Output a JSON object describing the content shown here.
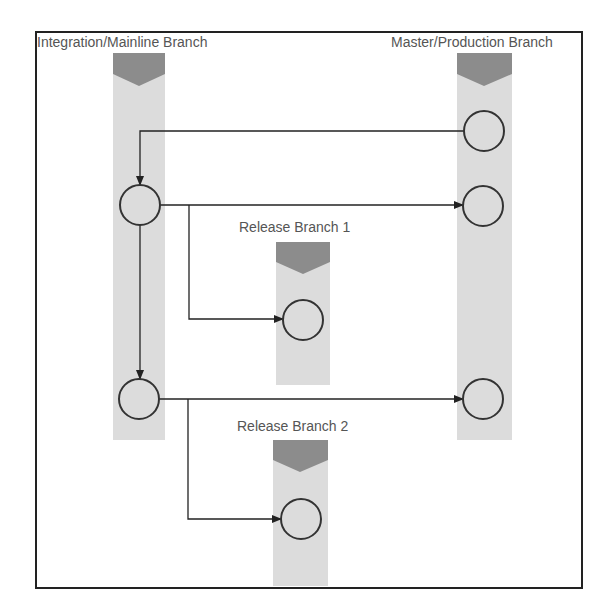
{
  "diagram": {
    "lanes": [
      {
        "id": "integration",
        "label": "Integration/Mainline Branch"
      },
      {
        "id": "master",
        "label": "Master/Production Branch"
      },
      {
        "id": "release1",
        "label": "Release Branch 1"
      },
      {
        "id": "release2",
        "label": "Release Branch 2"
      }
    ],
    "nodes": [
      {
        "id": "m1",
        "lane": "master"
      },
      {
        "id": "m2",
        "lane": "master"
      },
      {
        "id": "m3",
        "lane": "master"
      },
      {
        "id": "i1",
        "lane": "integration"
      },
      {
        "id": "i2",
        "lane": "integration"
      },
      {
        "id": "r1",
        "lane": "release1"
      },
      {
        "id": "r2",
        "lane": "release2"
      }
    ],
    "edges": [
      {
        "from": "m1",
        "to": "i1"
      },
      {
        "from": "i1",
        "to": "m2"
      },
      {
        "from": "i1",
        "to": "r1"
      },
      {
        "from": "i1",
        "to": "i2"
      },
      {
        "from": "i2",
        "to": "m3"
      },
      {
        "from": "i2",
        "to": "r2"
      }
    ],
    "colors": {
      "lane_body": "#dcdcdc",
      "lane_header": "#8c8c8c",
      "stroke": "#333333",
      "label": "#555555"
    }
  }
}
